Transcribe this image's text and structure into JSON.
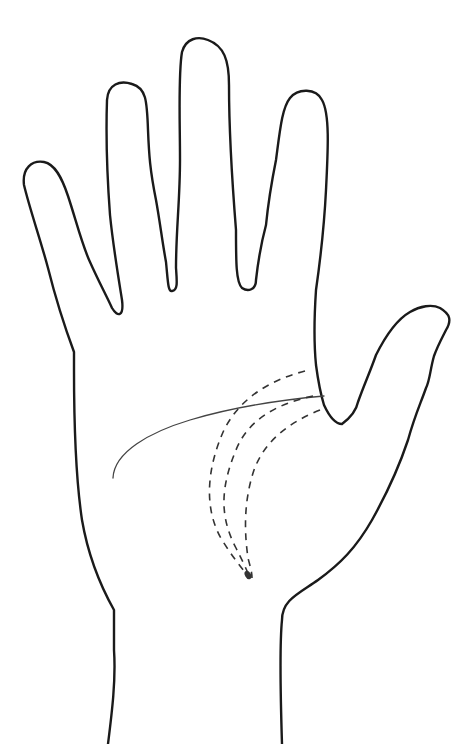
{
  "figure": {
    "width": 470,
    "height": 744,
    "background": "#ffffff",
    "outline_color": "#1a1a1a",
    "line_color": "#444444",
    "dash_color": "#333333",
    "hand_outline_path": "M 108 744 C 112 712 116 680 114 650 L 114 610 C 100 585 88 555 82 520 C 76 480 74 430 74 370 L 74 352 C 64 325 56 300 48 268 C 40 238 30 210 24 185 C 22 168 32 160 44 162 C 55 164 62 178 68 196 C 76 220 82 245 90 262 C 98 280 106 295 112 308 C 118 318 124 316 122 300 C 118 275 113 245 110 215 C 107 175 106 130 107 100 C 108 84 120 80 132 84 C 146 88 147 100 148 130 C 149 155 150 170 156 200 C 160 222 162 240 166 262 C 168 282 168 292 172 291 C 178 290 177 282 176 268 C 176 230 180 200 180 160 C 180 120 178 75 182 52 C 186 38 198 36 208 40 C 224 46 229 60 229 85 C 229 130 232 180 236 230 C 236 262 236 282 242 288 C 248 292 256 290 256 280 C 258 262 262 240 266 225 C 268 205 272 180 276 160 C 280 130 282 108 290 98 C 298 88 316 88 322 100 C 330 114 328 150 326 190 C 324 230 320 262 316 290 C 314 320 314 345 316 365 C 318 380 320 392 324 405 C 330 418 336 424 342 424 C 350 418 356 412 358 402 C 364 385 370 372 376 355 C 386 335 396 320 410 312 C 420 306 432 304 440 308 C 450 314 452 320 446 330 C 442 338 438 345 434 356 C 430 370 430 380 426 388 C 420 405 415 415 408 440 C 398 470 386 495 372 520 C 356 548 340 564 318 580 C 298 594 282 600 282 620 C 280 640 280 680 282 744",
    "heart_line_path": "M 113 478 C 114 452 150 432 190 420 C 230 408 280 400 324 396",
    "life_line_paths": [
      "M 305 371 C 270 380 240 398 224 430 C 206 470 204 510 222 540 C 232 556 240 566 248 576",
      "M 313 396 C 276 404 248 420 236 450 C 222 484 218 514 236 548 C 242 560 246 568 249 576",
      "M 320 410 C 290 422 265 440 254 470 C 244 500 244 530 248 558 C 250 566 252 572 252 578"
    ],
    "life_line_tip": {
      "cx": 248,
      "cy": 575,
      "rx": 3,
      "ry": 4.5
    }
  }
}
